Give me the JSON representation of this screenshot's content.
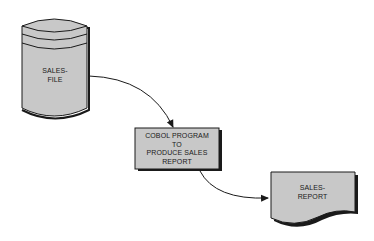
{
  "diagram": {
    "type": "flowchart",
    "colors": {
      "fill": "#c8c8c8",
      "stroke": "#1a1a1a",
      "background": "#ffffff"
    },
    "nodes": [
      {
        "id": "sales-file",
        "shape": "cylinder",
        "label_line1": "SALES-",
        "label_line2": "FILE"
      },
      {
        "id": "cobol-program",
        "shape": "process-box",
        "label_line1": "COBOL PROGRAM",
        "label_line2": "TO",
        "label_line3": "PRODUCE SALES",
        "label_line4": "REPORT"
      },
      {
        "id": "sales-report",
        "shape": "document",
        "label_line1": "SALES-",
        "label_line2": "REPORT"
      }
    ],
    "edges": [
      {
        "from": "sales-file",
        "to": "cobol-program"
      },
      {
        "from": "cobol-program",
        "to": "sales-report"
      }
    ]
  }
}
